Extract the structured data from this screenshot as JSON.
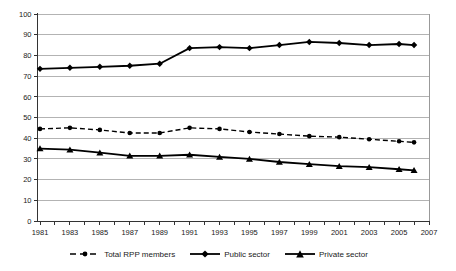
{
  "chart_data": {
    "type": "line",
    "title": "",
    "xlabel": "",
    "ylabel": "",
    "x": [
      1981,
      1983,
      1985,
      1987,
      1989,
      1991,
      1993,
      1995,
      1997,
      1999,
      2001,
      2003,
      2005,
      2006
    ],
    "series": [
      {
        "name": "Total RPP members",
        "marker": "circle",
        "line_style": "dashed",
        "values": [
          44.5,
          45,
          44,
          42.5,
          42.5,
          45,
          44.5,
          43,
          42,
          41,
          40.5,
          39.5,
          38.5,
          38
        ]
      },
      {
        "name": "Public sector",
        "marker": "diamond",
        "line_style": "solid",
        "values": [
          73.5,
          74,
          74.5,
          75,
          76,
          83.5,
          84,
          83.5,
          85,
          86.5,
          86,
          85,
          85.5,
          85
        ]
      },
      {
        "name": "Private sector",
        "marker": "triangle",
        "line_style": "solid",
        "values": [
          35,
          34.5,
          33,
          31.5,
          31.5,
          32,
          31,
          30,
          28.5,
          27.5,
          26.5,
          26,
          25,
          24.5
        ]
      }
    ],
    "ylim": [
      0,
      100
    ],
    "ytick_step": 10,
    "xlim": [
      1981,
      2007
    ],
    "xtick_labels": [
      "1981",
      "1983",
      "1985",
      "1987",
      "1989",
      "1991",
      "1993",
      "1995",
      "1997",
      "1999",
      "2001",
      "2003",
      "2005",
      "2007"
    ],
    "minor_xtick_every_years": 1,
    "grid": true,
    "legend_position": "bottom",
    "colors": {
      "series_line": "#000000",
      "grid": "#b3b3b3",
      "plot_border": "#999999",
      "axis": "#333333",
      "text": "#1a1a1a",
      "background": "#ffffff"
    }
  }
}
